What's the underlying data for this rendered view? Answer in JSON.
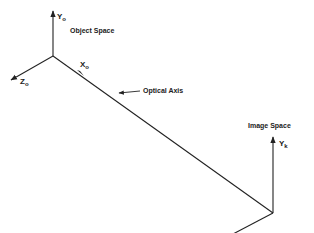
{
  "diagram": {
    "colors": {
      "line": "#222222",
      "background": "#ffffff"
    },
    "object_space": {
      "title": "Object Space",
      "axes": {
        "y": {
          "label": "Y",
          "subscript": "o"
        },
        "x": {
          "label": "X",
          "subscript": "o"
        },
        "z": {
          "label": "Z",
          "subscript": "o"
        }
      }
    },
    "optical_axis": {
      "label": "Optical Axis"
    },
    "image_space": {
      "title": "Image Space",
      "axes": {
        "y": {
          "label": "Y",
          "subscript": "k"
        },
        "z": {
          "label": "Z",
          "subscript": "k"
        }
      }
    }
  }
}
